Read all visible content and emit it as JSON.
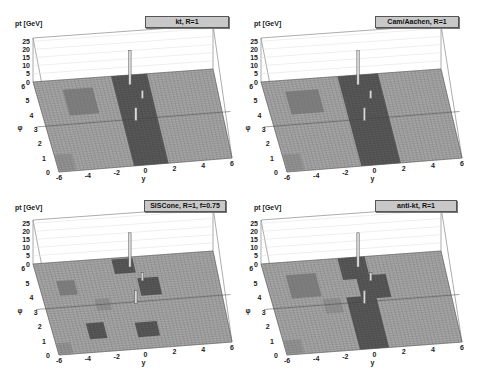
{
  "figure": {
    "panels": [
      {
        "title": "kₜ, R=1",
        "title_display": "kt, R=1"
      },
      {
        "title": "Cam/Aachen, R=1"
      },
      {
        "title": "SISCone, R=1, f=0.75"
      },
      {
        "title": "anti-kₜ, R=1",
        "title_display": "anti-kt, R=1"
      }
    ]
  },
  "chart_data": [
    {
      "type": "lego3d",
      "title": "kt, R=1",
      "zlabel": "pt [GeV]",
      "xlabel": "y",
      "ylabel": "φ",
      "x_ticks": [
        "-6",
        "-4",
        "-2",
        "0",
        "2",
        "4",
        "6"
      ],
      "y_ticks": [
        "0",
        "1",
        "2",
        "3",
        "4",
        "5",
        "6"
      ],
      "z_ticks": [
        "0",
        "5",
        "10",
        "15",
        "20",
        "25"
      ],
      "xlim": [
        -6,
        6
      ],
      "ylim": [
        0,
        6.28
      ],
      "zlim": [
        0,
        27
      ],
      "spikes": [
        {
          "y": 0.3,
          "phi": 5.6,
          "pt": 21
        },
        {
          "y": 0.1,
          "phi": 3.1,
          "pt": 8
        },
        {
          "y": 0.9,
          "phi": 4.6,
          "pt": 5
        }
      ],
      "regions": [
        {
          "shade": "dark",
          "y": [
            -0.8,
            1.6
          ],
          "phi": [
            0.0,
            6.28
          ]
        },
        {
          "shade": "mid",
          "y": [
            -4.2,
            -2.2
          ],
          "phi": [
            3.8,
            5.6
          ]
        },
        {
          "shade": "light",
          "y": [
            -6,
            -4.8
          ],
          "phi": [
            0.0,
            1.2
          ]
        }
      ]
    },
    {
      "type": "lego3d",
      "title": "Cam/Aachen, R=1",
      "zlabel": "pt [GeV]",
      "xlabel": "y",
      "ylabel": "φ",
      "x_ticks": [
        "-6",
        "-4",
        "-2",
        "0",
        "2",
        "4",
        "6"
      ],
      "y_ticks": [
        "0",
        "1",
        "2",
        "3",
        "4",
        "5",
        "6"
      ],
      "z_ticks": [
        "0",
        "5",
        "10",
        "15",
        "20",
        "25"
      ],
      "xlim": [
        -6,
        6
      ],
      "ylim": [
        0,
        6.28
      ],
      "zlim": [
        0,
        27
      ],
      "spikes": [
        {
          "y": 0.3,
          "phi": 5.6,
          "pt": 21
        },
        {
          "y": 0.1,
          "phi": 3.1,
          "pt": 8
        },
        {
          "y": 0.9,
          "phi": 4.6,
          "pt": 5
        }
      ],
      "regions": [
        {
          "shade": "dark",
          "y": [
            -0.9,
            1.8
          ],
          "phi": [
            0.0,
            6.28
          ]
        },
        {
          "shade": "mid",
          "y": [
            -4.6,
            -2.4
          ],
          "phi": [
            3.9,
            5.5
          ]
        },
        {
          "shade": "light",
          "y": [
            -6,
            -4.8
          ],
          "phi": [
            0.0,
            1.2
          ]
        }
      ]
    },
    {
      "type": "lego3d",
      "title": "SISCone, R=1, f=0.75",
      "zlabel": "pt [GeV]",
      "xlabel": "y",
      "ylabel": "φ",
      "x_ticks": [
        "-6",
        "-4",
        "-2",
        "0",
        "2",
        "4",
        "6"
      ],
      "y_ticks": [
        "0",
        "1",
        "2",
        "3",
        "4",
        "5",
        "6"
      ],
      "z_ticks": [
        "0",
        "5",
        "10",
        "15",
        "20",
        "25"
      ],
      "xlim": [
        -6,
        6
      ],
      "ylim": [
        0,
        6.28
      ],
      "zlim": [
        0,
        27
      ],
      "spikes": [
        {
          "y": 0.3,
          "phi": 5.6,
          "pt": 21
        },
        {
          "y": 0.1,
          "phi": 3.1,
          "pt": 8
        },
        {
          "y": 0.9,
          "phi": 4.6,
          "pt": 5
        }
      ],
      "regions": [
        {
          "shade": "dark",
          "y": [
            -0.8,
            0.6
          ],
          "phi": [
            5.2,
            6.2
          ]
        },
        {
          "shade": "dark",
          "y": [
            0.6,
            2.0
          ],
          "phi": [
            3.6,
            4.8
          ]
        },
        {
          "shade": "dark",
          "y": [
            -0.3,
            1.2
          ],
          "phi": [
            0.8,
            1.8
          ]
        },
        {
          "shade": "dark",
          "y": [
            -3.6,
            -2.4
          ],
          "phi": [
            0.9,
            2.0
          ]
        },
        {
          "shade": "mid",
          "y": [
            -4.8,
            -3.6
          ],
          "phi": [
            4.0,
            5.0
          ]
        },
        {
          "shade": "light",
          "y": [
            -2.6,
            -1.6
          ],
          "phi": [
            2.8,
            3.6
          ]
        },
        {
          "shade": "light",
          "y": [
            -6,
            -5.0
          ],
          "phi": [
            0.0,
            0.8
          ]
        }
      ]
    },
    {
      "type": "lego3d",
      "title": "anti-kt, R=1",
      "zlabel": "pt [GeV]",
      "xlabel": "y",
      "ylabel": "φ",
      "x_ticks": [
        "-6",
        "-4",
        "-2",
        "0",
        "2",
        "4",
        "6"
      ],
      "y_ticks": [
        "0",
        "1",
        "2",
        "3",
        "4",
        "5",
        "6"
      ],
      "z_ticks": [
        "0",
        "5",
        "10",
        "15",
        "20",
        "25"
      ],
      "xlim": [
        -6,
        6
      ],
      "ylim": [
        0,
        6.28
      ],
      "zlim": [
        0,
        27
      ],
      "spikes": [
        {
          "y": 0.3,
          "phi": 5.6,
          "pt": 21
        },
        {
          "y": 0.1,
          "phi": 3.1,
          "pt": 8
        },
        {
          "y": 0.9,
          "phi": 4.6,
          "pt": 5
        }
      ],
      "regions": [
        {
          "shade": "dark",
          "y": [
            -0.9,
            0.9
          ],
          "phi": [
            4.8,
            6.28
          ]
        },
        {
          "shade": "dark",
          "y": [
            0.0,
            2.0
          ],
          "phi": [
            3.4,
            5.0
          ]
        },
        {
          "shade": "dark",
          "y": [
            -1.0,
            1.0
          ],
          "phi": [
            0.0,
            3.6
          ]
        },
        {
          "shade": "mid",
          "y": [
            -4.6,
            -2.6
          ],
          "phi": [
            3.8,
            5.4
          ]
        },
        {
          "shade": "light",
          "y": [
            -2.6,
            -1.4
          ],
          "phi": [
            2.6,
            3.6
          ]
        },
        {
          "shade": "light",
          "y": [
            -6,
            -4.8
          ],
          "phi": [
            0.0,
            1.0
          ]
        }
      ]
    }
  ],
  "colors": {
    "floor": "#a6a6a6",
    "grid": "#6e6e6e",
    "dark": "#4e4e4e",
    "mid": "#7f7f7f",
    "light": "#939393",
    "box": "#888888",
    "spike": "#d8d8d8"
  }
}
